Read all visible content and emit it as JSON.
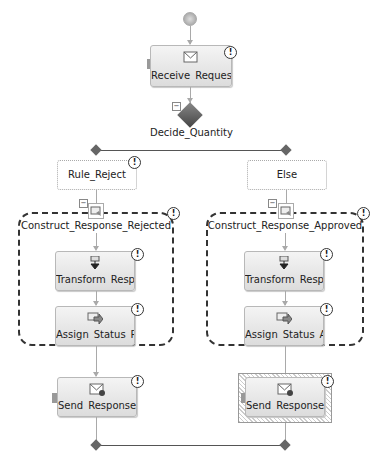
{
  "diagram": {
    "start": {
      "name": "start-node"
    },
    "receive": {
      "label": "Receive_Reques..."
    },
    "decide": {
      "label": "Decide_Quantity"
    },
    "branches": [
      {
        "rule_label": "Rule_Reject",
        "scope_label": "Construct_Response_Rejected",
        "transform_label": "Transform_Resp...",
        "assign_label": "Assign_Status_R...",
        "send_label": "Send_Response ..."
      },
      {
        "rule_label": "Else",
        "scope_label": "Construct_Response_Approved",
        "transform_label": "Transform_Resp...",
        "assign_label": "Assign_Status_A ...",
        "send_label": "Send_Response ..."
      }
    ],
    "warning_glyph": "!",
    "collapse_glyph": "−",
    "colors": {
      "connector": "#a9a9a9",
      "decision": "#5a5a5a",
      "shape_fill_top": "#f4f4f4",
      "shape_fill_bottom": "#dcdcdc",
      "scope_border": "#333333"
    }
  }
}
